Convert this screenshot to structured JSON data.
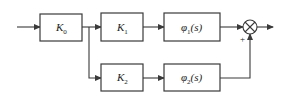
{
  "diagram": {
    "type": "block-diagram",
    "blocks": [
      {
        "id": "k0",
        "symbol": "K",
        "subscript": "0",
        "suffix": ""
      },
      {
        "id": "k1",
        "symbol": "K",
        "subscript": "1",
        "suffix": ""
      },
      {
        "id": "k2",
        "symbol": "K",
        "subscript": "2",
        "suffix": ""
      },
      {
        "id": "phi1",
        "symbol": "φ",
        "subscript": "1",
        "suffix": "(s)"
      },
      {
        "id": "phi2",
        "symbol": "φ",
        "subscript": "2",
        "suffix": "(s)"
      }
    ],
    "summing_junction": {
      "id": "sum",
      "signs": {
        "bottom": "+"
      }
    },
    "connections": [
      {
        "from": "input",
        "to": "k0"
      },
      {
        "from": "k0",
        "to": "k1"
      },
      {
        "from": "k0",
        "to": "k2"
      },
      {
        "from": "k1",
        "to": "phi1"
      },
      {
        "from": "k2",
        "to": "phi2"
      },
      {
        "from": "phi1",
        "to": "sum"
      },
      {
        "from": "phi2",
        "to": "sum"
      },
      {
        "from": "sum",
        "to": "output"
      }
    ]
  }
}
